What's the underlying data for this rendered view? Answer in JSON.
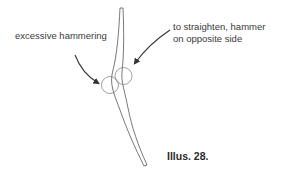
{
  "figure": {
    "labels": {
      "left": "excessive hammering",
      "right_line1": "to straighten, hammer",
      "right_line2": "on opposite side"
    },
    "caption": "Illus. 28.",
    "colors": {
      "stroke": "#555555",
      "text": "#3a3a3a",
      "background": "#ffffff"
    }
  }
}
